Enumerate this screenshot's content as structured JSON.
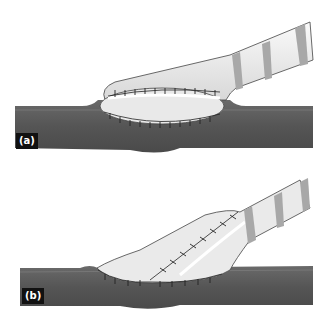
{
  "figure": {
    "panels": [
      {
        "label": "(a)",
        "description": "Graft hood anastomosis, end-to-side with oval suture line around vessel opening"
      },
      {
        "label": "(b)",
        "description": "Graft anastomosis with elongated spatulated hood and longitudinal suture line"
      }
    ],
    "colors": {
      "vessel": "#5a5a5a",
      "vessel_highlight": "#7a7a7a",
      "graft": "#eeeeee",
      "graft_shade": "#d4d4d4",
      "rings": "#a8a8a8",
      "suture": "#222222",
      "label_bg": "#111111",
      "label_text": "#ffffff"
    }
  }
}
